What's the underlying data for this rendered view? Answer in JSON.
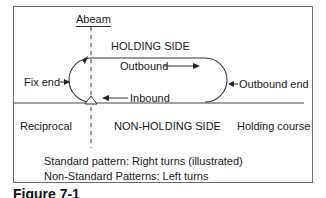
{
  "diagram": {
    "labels": {
      "abeam": "Abeam",
      "holding_side": "HOLDING SIDE",
      "outbound": "Outbound",
      "fix_end": "Fix end",
      "outbound_end": "Outbound end",
      "inbound": "Inbound",
      "reciprocal": "Reciprocal",
      "non_holding_side": "NON-HOLDING SIDE",
      "holding_course": "Holding course"
    },
    "notes": {
      "standard": "Standard pattern: Right turns (illustrated)",
      "non_standard": "Non-Standard Patterns: Left turns"
    },
    "caption": "Figure 7-1",
    "colors": {
      "line": "#333333",
      "frame": "#6e6e6e",
      "text": "#1a1a1a"
    }
  }
}
